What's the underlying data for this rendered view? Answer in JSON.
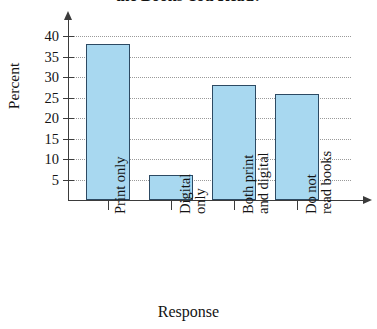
{
  "chart_data": {
    "type": "bar",
    "title": "the Books You Read?",
    "xlabel": "Response",
    "ylabel": "Percent",
    "categories": [
      "Print only",
      "Digital only",
      "Both print and digital",
      "Do not read books"
    ],
    "category_lines": [
      [
        "Print only"
      ],
      [
        "Digital",
        "only"
      ],
      [
        "Both print",
        "and digital"
      ],
      [
        "Do not",
        "read books"
      ]
    ],
    "values": [
      38,
      6,
      28,
      26
    ],
    "ylim": [
      0,
      42
    ],
    "yticks": [
      5,
      10,
      15,
      20,
      25,
      30,
      35,
      40
    ],
    "ytick_labels": [
      "5",
      "10",
      "15",
      "20",
      "25",
      "30",
      "35",
      "40"
    ],
    "grid": true,
    "legend": "none",
    "bar_fill_color": "#a8d8f0",
    "bar_border_color": "#2d4a63",
    "axis_color": "#3b3b3b",
    "grid_color": "#9a9a9a"
  }
}
